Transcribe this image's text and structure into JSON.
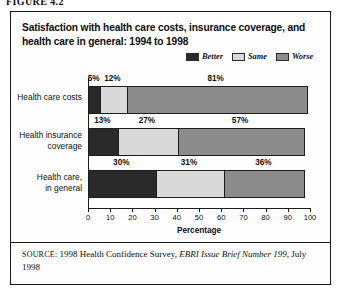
{
  "figure": {
    "label": "FIGURE 4.2"
  },
  "chart_title": "Satisfaction with health care costs, insurance coverage, and health care in general: 1994 to 1998",
  "legend": {
    "position": "top-right",
    "entries": [
      {
        "label": "Better",
        "color": "#2a2a2a"
      },
      {
        "label": "Same",
        "color": "#d9d9d9"
      },
      {
        "label": "Worse",
        "color": "#8c8c8c"
      }
    ]
  },
  "source": {
    "keyword": "SOURCE",
    "text_before_italic": ": 1998 Health Confidence Survey, ",
    "italic_text": "EBRI Issue Brief Number 199",
    "text_after_italic": ", July 1998"
  },
  "chart_data": {
    "type": "bar",
    "orientation": "horizontal",
    "stacked": true,
    "title": "Satisfaction with health care costs, insurance coverage, and health care in general: 1994 to 1998",
    "xlabel": "Percentage",
    "ylabel": "",
    "xlim": [
      0,
      100
    ],
    "xticks": [
      0,
      10,
      20,
      30,
      40,
      50,
      60,
      70,
      80,
      90,
      100
    ],
    "xtick_labels": [
      "0",
      "10",
      "20",
      "30",
      "40",
      "50",
      "60",
      "70",
      "80",
      "90",
      "100"
    ],
    "grid": false,
    "legend_position": "top-right",
    "categories": [
      "Health care costs",
      "Health insurance coverage",
      "Health care, in general"
    ],
    "category_lines": [
      [
        "Health care costs"
      ],
      [
        "Health insurance",
        "coverage"
      ],
      [
        "Health care,",
        "in general"
      ]
    ],
    "series": [
      {
        "name": "Better",
        "color": "#2a2a2a",
        "values": [
          5,
          13,
          30
        ]
      },
      {
        "name": "Same",
        "color": "#d9d9d9",
        "values": [
          12,
          27,
          31
        ]
      },
      {
        "name": "Worse",
        "color": "#8c8c8c",
        "values": [
          81,
          57,
          36
        ]
      }
    ],
    "data_labels": [
      [
        "5%",
        "12%",
        "81%"
      ],
      [
        "13%",
        "27%",
        "57%"
      ],
      [
        "30%",
        "31%",
        "36%"
      ]
    ]
  }
}
